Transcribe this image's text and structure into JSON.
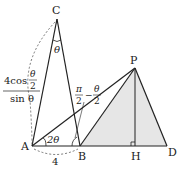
{
  "diagram": {
    "points": {
      "A": {
        "label": "A",
        "x": 32,
        "y": 146
      },
      "B": {
        "label": "B",
        "x": 80,
        "y": 146
      },
      "C": {
        "label": "C",
        "x": 57,
        "y": 19
      },
      "P": {
        "label": "P",
        "x": 135,
        "y": 68
      },
      "H": {
        "label": "H",
        "x": 135,
        "y": 146
      },
      "D": {
        "label": "D",
        "x": 167,
        "y": 146
      }
    },
    "labels": {
      "angle_C": "θ",
      "angle_A": "2θ",
      "angle_B_num": "π",
      "angle_B_den": "2",
      "angle_B_minus": "−",
      "angle_B_theta": "θ",
      "angle_B_theta_den": "2",
      "length_AB": "4",
      "length_AC_num": "4cos",
      "length_AC_num_theta": "θ",
      "length_AC_num_den": "2",
      "length_AC_den": "sin θ"
    },
    "colors": {
      "line": "#222222",
      "fill": "#e6e6e6",
      "dashed": "#555555"
    }
  }
}
